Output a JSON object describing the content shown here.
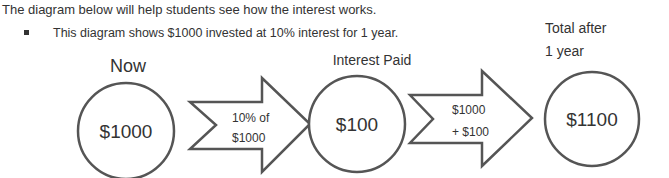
{
  "intro_text": "The diagram below will help students see how the interest works.",
  "bullet_text": "This diagram shows $1000 invested at 10% interest for 1 year.",
  "diagram": {
    "stages": [
      {
        "heading": "Now",
        "value": "$1000"
      },
      {
        "heading": "Interest Paid",
        "value": "$100"
      },
      {
        "heading_line1": "Total after",
        "heading_line2": "1 year",
        "value": "$1100"
      }
    ],
    "arrows": [
      {
        "line1": "10% of",
        "line2": "$1000"
      },
      {
        "line1": "$1000",
        "line2": "+ $100"
      }
    ]
  }
}
